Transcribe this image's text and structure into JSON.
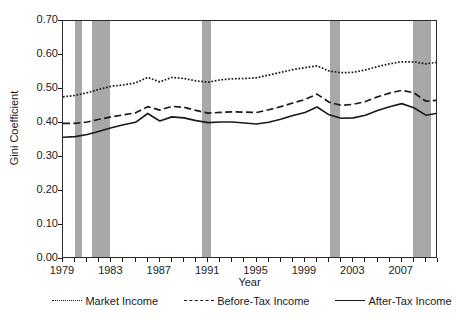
{
  "chart_data": {
    "type": "line",
    "title": "",
    "xlabel": "Year",
    "ylabel": "Gini Coefficient",
    "xlim": [
      1979,
      2010
    ],
    "ylim": [
      0.0,
      0.7
    ],
    "grid": false,
    "legend_position": "bottom",
    "y_ticks": [
      "0.00",
      "0.10",
      "0.20",
      "0.30",
      "0.40",
      "0.50",
      "0.60",
      "0.70"
    ],
    "y_tick_values": [
      0.0,
      0.1,
      0.2,
      0.3,
      0.4,
      0.5,
      0.6,
      0.7
    ],
    "x_ticks": [
      "1979",
      "1983",
      "1987",
      "1991",
      "1995",
      "1999",
      "2003",
      "2007"
    ],
    "x_tick_values": [
      1979,
      1983,
      1987,
      1991,
      1995,
      1999,
      2003,
      2007
    ],
    "x_minor_tick_values": [
      1980,
      1981,
      1982,
      1984,
      1985,
      1986,
      1988,
      1989,
      1990,
      1992,
      1993,
      1994,
      1996,
      1997,
      1998,
      2000,
      2001,
      2002,
      2004,
      2005,
      2006,
      2008,
      2009,
      2010
    ],
    "x": [
      1979,
      1980,
      1981,
      1982,
      1983,
      1984,
      1985,
      1986,
      1987,
      1988,
      1989,
      1990,
      1991,
      1992,
      1993,
      1994,
      1995,
      1996,
      1997,
      1998,
      1999,
      2000,
      2001,
      2002,
      2003,
      2004,
      2005,
      2006,
      2007,
      2008,
      2009,
      2010
    ],
    "series": [
      {
        "name": "Market Income",
        "style": "dotted",
        "color": "#1a1a1a",
        "values": [
          0.477,
          0.481,
          0.489,
          0.499,
          0.508,
          0.512,
          0.518,
          0.534,
          0.521,
          0.534,
          0.531,
          0.524,
          0.52,
          0.527,
          0.53,
          0.531,
          0.533,
          0.541,
          0.549,
          0.557,
          0.563,
          0.568,
          0.553,
          0.548,
          0.549,
          0.556,
          0.566,
          0.574,
          0.58,
          0.58,
          0.574,
          0.579
        ]
      },
      {
        "name": "Before-Tax Income",
        "style": "dashed",
        "color": "#1a1a1a",
        "values": [
          0.399,
          0.399,
          0.403,
          0.411,
          0.418,
          0.424,
          0.43,
          0.448,
          0.438,
          0.449,
          0.446,
          0.437,
          0.429,
          0.431,
          0.433,
          0.432,
          0.431,
          0.439,
          0.448,
          0.459,
          0.469,
          0.485,
          0.461,
          0.452,
          0.455,
          0.463,
          0.477,
          0.488,
          0.496,
          0.489,
          0.464,
          0.467
        ]
      },
      {
        "name": "After-Tax Income",
        "style": "solid",
        "color": "#1a1a1a",
        "values": [
          0.358,
          0.36,
          0.366,
          0.376,
          0.386,
          0.395,
          0.402,
          0.428,
          0.406,
          0.418,
          0.415,
          0.407,
          0.401,
          0.403,
          0.403,
          0.4,
          0.397,
          0.402,
          0.411,
          0.422,
          0.431,
          0.447,
          0.424,
          0.414,
          0.415,
          0.423,
          0.437,
          0.448,
          0.457,
          0.445,
          0.423,
          0.429
        ]
      }
    ],
    "shaded_bands": {
      "name": "recession-band",
      "color": "#a8a8a8",
      "ranges": [
        {
          "start": 1980.0,
          "end": 1980.6
        },
        {
          "start": 1981.4,
          "end": 1982.9
        },
        {
          "start": 1990.5,
          "end": 1991.2
        },
        {
          "start": 2001.1,
          "end": 2001.9
        },
        {
          "start": 2007.9,
          "end": 2009.4
        }
      ]
    }
  },
  "legend": {
    "items": [
      {
        "label": "Market Income",
        "style": "dotted"
      },
      {
        "label": "Before-Tax Income",
        "style": "dashed"
      },
      {
        "label": "After-Tax Income",
        "style": "solid"
      }
    ]
  }
}
